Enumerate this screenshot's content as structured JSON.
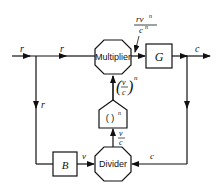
{
  "diagram": {
    "blocks": {
      "multiplier": "Multiplier",
      "g": "G",
      "power": "( )",
      "power_exp": "n",
      "divider": "Divider",
      "b": "B"
    },
    "signals": {
      "r_in": "r",
      "r_mid": "r",
      "r_down": "r",
      "c_out": "c",
      "c_feedback": "c",
      "v": "v",
      "v_over_c_num": "v",
      "v_over_c_den": "c",
      "pow_num": "v",
      "pow_den": "c",
      "pow_exp": "n",
      "mult_out_num": "rv",
      "mult_out_num_exp": "n",
      "mult_out_den": "c",
      "mult_out_den_exp": "n"
    }
  }
}
